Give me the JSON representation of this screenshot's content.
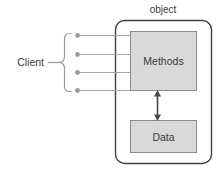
{
  "diagram": {
    "title_label": "object",
    "client_label": "Client",
    "methods_label": "Methods",
    "data_label": "Data",
    "connector_count": 4,
    "colors": {
      "box_fill": "#d9d9d9",
      "box_stroke": "#8c8c8c",
      "container_stroke": "#3f3f3f",
      "line_stroke": "#a6a6a6",
      "dot_fill": "#9a9a9a",
      "arrow_stroke": "#4a4a4a",
      "text": "#3b3b3b",
      "background": "#ffffff"
    }
  }
}
